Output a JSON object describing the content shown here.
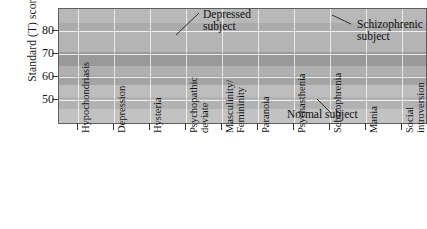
{
  "chart_data": {
    "type": "line",
    "title": "",
    "xlabel": "",
    "ylabel": "Standard (T) score",
    "ylim": [
      42,
      90
    ],
    "yticks": [
      50,
      60,
      70,
      80
    ],
    "grid": true,
    "legend_position": "inline-annotations",
    "categories": [
      "Hypochondriasis",
      "Depression",
      "Hysteria",
      "Psychopathic\ndeviate",
      "Masculinity/\nFemininity",
      "Paranoia",
      "Psychasthenia",
      "Schizophrenia",
      "Mania",
      "Social\nintroversion"
    ],
    "series": [
      {
        "name": "Depressed subject",
        "values": [
          56,
          80,
          76,
          73,
          52,
          57,
          59,
          67,
          58,
          53
        ]
      },
      {
        "name": "Schizophrenic subject",
        "values": [
          52,
          52,
          52,
          52,
          53,
          73,
          75,
          85,
          55,
          64
        ]
      },
      {
        "name": "Normal subject",
        "values": [
          51,
          51,
          51,
          50,
          52,
          54,
          54,
          54,
          53,
          47
        ]
      }
    ],
    "annotations": [
      {
        "text": "Depressed\nsubject",
        "target_series": "Depressed subject"
      },
      {
        "text": "Schizophrenic\nsubject",
        "target_series": "Schizophrenic subject"
      },
      {
        "text": "Normal subject",
        "target_series": "Normal subject"
      }
    ]
  },
  "axis": {
    "y_title": "Standard (T) score",
    "y_ticks": [
      "80",
      "70",
      "60",
      "50"
    ]
  },
  "colors": {
    "series_dark": "#262626",
    "series_mid": "#3c3c3c",
    "series_light": "#6e6e6e",
    "frame": "#5d5d5d",
    "grid": "#ffffff",
    "text": "#141414"
  }
}
